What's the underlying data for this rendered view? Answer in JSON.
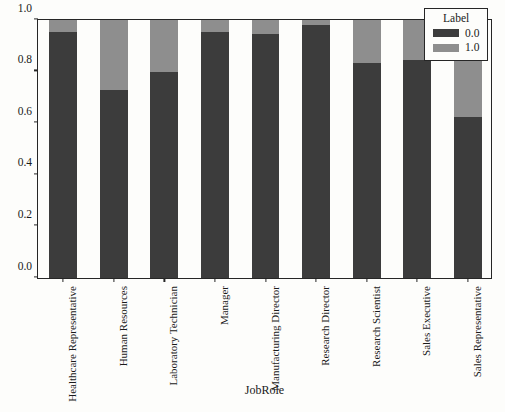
{
  "chart_data": {
    "type": "bar",
    "stacked": true,
    "normalized": true,
    "title": "",
    "xlabel": "JobRole",
    "ylabel": "",
    "ylim": [
      0.0,
      1.0
    ],
    "yticks": [
      "0.0",
      "0.2",
      "0.4",
      "0.6",
      "0.8",
      "1.0"
    ],
    "ytick_values": [
      0.0,
      0.2,
      0.4,
      0.6,
      0.8,
      1.0
    ],
    "grid": false,
    "legend": {
      "title": "Label",
      "position": "top-right",
      "entries": [
        {
          "label": "0.0",
          "color": "#3c3c3c"
        },
        {
          "label": "1.0",
          "color": "#8e8e8e"
        }
      ]
    },
    "categories": [
      "Healthcare Representative",
      "Human Resources",
      "Laboratory Technician",
      "Manager",
      "Manufacturing Director",
      "Research Director",
      "Research Scientist",
      "Sales Executive",
      "Sales Representative"
    ],
    "series": [
      {
        "name": "0.0",
        "color": "#3c3c3c",
        "values": [
          0.955,
          0.73,
          0.8,
          0.955,
          0.945,
          0.98,
          0.835,
          0.845,
          0.625
        ]
      },
      {
        "name": "1.0",
        "color": "#8e8e8e",
        "values": [
          0.045,
          0.27,
          0.2,
          0.045,
          0.055,
          0.02,
          0.165,
          0.155,
          0.375
        ]
      }
    ]
  }
}
